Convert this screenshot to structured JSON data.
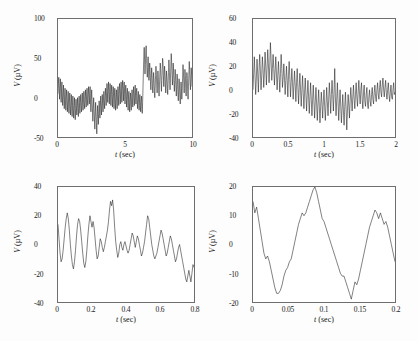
{
  "figure": {
    "background": "#fdfdfd",
    "axis_color": "#6e6e6e",
    "trace_color": "#1a1a1a"
  },
  "chart_data": [
    {
      "id": "panel-top-left",
      "type": "line",
      "title": "",
      "xlabel": "t (sec)",
      "xlabel_italic_part": "t",
      "xlabel_rest": " (sec)",
      "ylabel": "V (µV)",
      "ylabel_italic_part": "V",
      "ylabel_rest": " (µV)",
      "xlim": [
        0,
        10
      ],
      "ylim": [
        -50,
        100
      ],
      "xticks": [
        0,
        5,
        10
      ],
      "xticklabels": [
        "0",
        "5",
        "10"
      ],
      "yticks": [
        -50,
        0,
        50,
        100
      ],
      "yticklabels": [
        "-50",
        "0",
        "50",
        "100"
      ],
      "grid": false,
      "legend": null,
      "description": "10 second raw EEG epoch, broadband noise about 0 uV with bursts",
      "series": [
        {
          "name": "EEG",
          "sampling_note": "dense noisy trace, envelope varies 10-45 uV",
          "values": [
            5,
            18,
            26,
            12,
            -2,
            14,
            24,
            8,
            -6,
            10,
            20,
            2,
            -10,
            6,
            16,
            -2,
            -14,
            2,
            12,
            -4,
            -16,
            0,
            10,
            -6,
            -18,
            -4,
            8,
            -8,
            -20,
            -6,
            6,
            -10,
            -22,
            -8,
            4,
            -12,
            -24,
            -10,
            2,
            -14,
            -26,
            -12,
            0,
            -16,
            -28,
            -14,
            -2,
            -12,
            -22,
            -10,
            0,
            -14,
            -24,
            -8,
            2,
            -12,
            -20,
            -6,
            4,
            -10,
            -18,
            -4,
            6,
            -8,
            -16,
            -2,
            8,
            -6,
            -14,
            0,
            10,
            -4,
            -12,
            2,
            12,
            -2,
            -10,
            4,
            14,
            0,
            -8,
            6,
            14,
            -6,
            -18,
            -2,
            10,
            -4,
            -16,
            -30,
            -14,
            0,
            -12,
            -26,
            -40,
            -22,
            -6,
            -18,
            -32,
            -46,
            -28,
            -10,
            -20,
            -34,
            -20,
            -4,
            -14,
            -26,
            -12,
            2,
            -10,
            -22,
            -8,
            4,
            -8,
            -18,
            -4,
            8,
            -4,
            -14,
            0,
            12,
            2,
            -10,
            6,
            18,
            8,
            -6,
            10,
            20,
            6,
            -8,
            8,
            18,
            4,
            -10,
            6,
            16,
            2,
            -12,
            4,
            14,
            0,
            -14,
            2,
            12,
            -2,
            -16,
            0,
            10,
            -4,
            -14,
            2,
            14,
            4,
            -10,
            8,
            18,
            6,
            -8,
            10,
            20,
            8,
            -6,
            12,
            22,
            10,
            -4,
            14,
            20,
            6,
            -8,
            10,
            16,
            2,
            -12,
            6,
            12,
            -2,
            -16,
            2,
            8,
            -6,
            -18,
            -2,
            6,
            -8,
            -16,
            0,
            10,
            -4,
            -12,
            4,
            14,
            0,
            -10,
            6,
            16,
            2,
            -8,
            8,
            12,
            -4,
            -14,
            0,
            8,
            -6,
            -16,
            -2,
            4,
            -10,
            -18,
            -4,
            2,
            -12,
            -20,
            -6,
            14,
            34,
            52,
            64,
            48,
            30,
            42,
            58,
            66,
            50,
            34,
            26,
            40,
            52,
            38,
            22,
            30,
            44,
            36,
            20,
            10,
            24,
            38,
            30,
            14,
            6,
            18,
            32,
            24,
            8,
            0,
            12,
            28,
            40,
            30,
            16,
            6,
            20,
            34,
            26,
            10,
            2,
            16,
            30,
            44,
            36,
            20,
            8,
            22,
            36,
            50,
            44,
            28,
            14,
            26,
            40,
            32,
            16,
            6,
            20,
            34,
            26,
            12,
            4,
            18,
            32,
            48,
            38,
            22,
            10,
            24,
            40,
            56,
            46,
            30,
            16,
            28,
            44,
            34,
            18,
            8,
            22,
            36,
            28,
            12,
            2,
            16,
            30,
            22,
            6,
            -4,
            10,
            24,
            16,
            0,
            -8,
            6,
            20,
            12,
            -2,
            8,
            26,
            42,
            34,
            18,
            6,
            20,
            36,
            28,
            12,
            2,
            16,
            32,
            24,
            8,
            -2,
            14,
            30,
            46,
            36,
            20,
            10,
            24,
            38,
            30,
            14
          ]
        }
      ]
    },
    {
      "id": "panel-top-right",
      "type": "line",
      "title": "",
      "xlabel": "t (sec)",
      "xlabel_italic_part": "t",
      "xlabel_rest": " (sec)",
      "ylabel": "V (µV)",
      "ylabel_italic_part": "V",
      "ylabel_rest": " (µV)",
      "xlim": [
        0,
        2
      ],
      "ylim": [
        -40,
        60
      ],
      "xticks": [
        0,
        0.5,
        1,
        1.5,
        2
      ],
      "xticklabels": [
        "0",
        "0.5",
        "1",
        "1.5",
        "2"
      ],
      "yticks": [
        -40,
        -20,
        0,
        20,
        40,
        60
      ],
      "yticklabels": [
        "-40",
        "-20",
        "0",
        "20",
        "40",
        "60"
      ],
      "grid": false,
      "legend": null,
      "description": "First 2 seconds expanded, strong alpha rhythm decaying into low amplitude activity",
      "series": [
        {
          "name": "EEG",
          "values": [
            0,
            14,
            28,
            12,
            -4,
            10,
            26,
            14,
            -2,
            16,
            30,
            16,
            0,
            12,
            28,
            18,
            2,
            14,
            32,
            20,
            4,
            18,
            34,
            22,
            6,
            20,
            40,
            26,
            8,
            18,
            30,
            18,
            4,
            16,
            28,
            14,
            0,
            12,
            24,
            12,
            -2,
            14,
            30,
            18,
            2,
            10,
            22,
            10,
            -4,
            8,
            20,
            8,
            -6,
            12,
            24,
            10,
            -6,
            6,
            18,
            6,
            -8,
            4,
            16,
            4,
            -10,
            6,
            18,
            2,
            -12,
            2,
            14,
            0,
            -14,
            0,
            12,
            -2,
            -16,
            -2,
            10,
            -4,
            -18,
            -4,
            8,
            -6,
            -20,
            -6,
            6,
            -8,
            -22,
            -8,
            4,
            -10,
            -24,
            -10,
            2,
            -12,
            -26,
            -12,
            0,
            -14,
            -28,
            -14,
            -2,
            -12,
            -24,
            -10,
            0,
            -14,
            -26,
            -12,
            2,
            -10,
            -22,
            -8,
            6,
            -6,
            -20,
            -4,
            8,
            -4,
            -18,
            -2,
            18,
            -6,
            -22,
            -8,
            6,
            -10,
            -26,
            -12,
            0,
            -14,
            -28,
            -16,
            -4,
            -18,
            -30,
            -14,
            -2,
            -16,
            -34,
            -18,
            -4,
            -12,
            -24,
            -10,
            2,
            -8,
            -18,
            -6,
            4,
            -8,
            -16,
            -4,
            6,
            -6,
            -14,
            -2,
            8,
            -4,
            -12,
            0,
            6,
            -8,
            -16,
            -2,
            4,
            -10,
            -14,
            -4,
            2,
            -12,
            -16,
            -6,
            0,
            -10,
            -14,
            -4,
            2,
            -8,
            -12,
            -2,
            4,
            -6,
            -10,
            0,
            6,
            -4,
            -8,
            2,
            8,
            -2,
            -6,
            4,
            10,
            0,
            -6,
            2,
            8,
            -2,
            -8,
            0,
            6,
            -4,
            -10,
            -2,
            4,
            -6,
            -8,
            0,
            6,
            -4,
            -2
          ]
        }
      ]
    },
    {
      "id": "panel-bottom-left",
      "type": "line",
      "title": "",
      "xlabel": "t (sec)",
      "xlabel_italic_part": "t",
      "xlabel_rest": " (sec)",
      "ylabel": "V (µV)",
      "ylabel_italic_part": "V",
      "ylabel_rest": " (µV)",
      "xlim": [
        0,
        0.8
      ],
      "ylim": [
        -40,
        40
      ],
      "xticks": [
        0,
        0.2,
        0.4,
        0.6,
        0.8
      ],
      "xticklabels": [
        "0",
        "0.2",
        "0.4",
        "0.6",
        "0.8"
      ],
      "yticks": [
        -40,
        -20,
        0,
        20,
        40
      ],
      "yticklabels": [
        "-40",
        "-20",
        "0",
        "20",
        "40"
      ],
      "grid": false,
      "legend": null,
      "description": "First 0.8 seconds expanded, rhythmic oscillation near 10 Hz with peak 31 uV at 0.34 s",
      "series": [
        {
          "name": "EEG",
          "values": [
            14,
            4,
            -6,
            -12,
            -10,
            -4,
            4,
            12,
            18,
            22,
            18,
            10,
            0,
            -8,
            -14,
            -17,
            -12,
            -4,
            6,
            14,
            18,
            16,
            10,
            2,
            -6,
            -13,
            -16,
            -12,
            -4,
            6,
            14,
            20,
            16,
            12,
            16,
            12,
            4,
            -4,
            -10,
            -8,
            -2,
            4,
            2,
            -2,
            -5,
            -2,
            2,
            6,
            10,
            16,
            24,
            30,
            27,
            31,
            24,
            12,
            2,
            -4,
            -9,
            -6,
            0,
            2,
            -2,
            -4,
            0,
            2,
            -1,
            -4,
            -6,
            -4,
            0,
            4,
            8,
            6,
            2,
            -2,
            2,
            6,
            4,
            0,
            -4,
            -8,
            -6,
            -2,
            2,
            8,
            14,
            20,
            18,
            12,
            6,
            0,
            -4,
            -8,
            -10,
            -8,
            -6,
            -2,
            2,
            6,
            10,
            8,
            4,
            0,
            -4,
            -8,
            -6,
            -2,
            2,
            6,
            4,
            0,
            -4,
            -8,
            -12,
            -10,
            -6,
            -2,
            0,
            -4,
            -8,
            -12,
            -16,
            -20,
            -24,
            -26,
            -22,
            -18,
            -22,
            -26,
            -20,
            -14,
            -16
          ]
        }
      ]
    },
    {
      "id": "panel-bottom-right",
      "type": "line",
      "title": "",
      "xlabel": "t (sec)",
      "xlabel_italic_part": "t",
      "xlabel_rest": " (sec)",
      "ylabel": "V (µV)",
      "ylabel_italic_part": "V",
      "ylabel_rest": " (µV)",
      "xlim": [
        0,
        0.2
      ],
      "ylim": [
        -20,
        20
      ],
      "xticks": [
        0,
        0.05,
        0.1,
        0.15,
        0.2
      ],
      "xticklabels": [
        "0",
        "0.05",
        "0.1",
        "0.15",
        "0.2"
      ],
      "yticks": [
        -20,
        -10,
        0,
        10,
        20
      ],
      "yticklabels": [
        "-20",
        "-10",
        "0",
        "10",
        "20"
      ],
      "grid": false,
      "legend": null,
      "description": "First 0.2 seconds expanded, roughly two alpha cycles resolved sample by sample",
      "series": [
        {
          "name": "EEG",
          "values": [
            15,
            11,
            13,
            9,
            5,
            1,
            -3,
            -5,
            -4,
            -6,
            -9,
            -12,
            -15,
            -17,
            -17,
            -16,
            -14,
            -11,
            -9,
            -8,
            -6,
            -5,
            -2,
            1,
            4,
            7,
            9,
            11,
            10,
            11,
            13,
            15,
            17,
            19,
            20,
            18,
            15,
            12,
            9,
            8,
            6,
            4,
            2,
            0,
            -2,
            -4,
            -6,
            -8,
            -10,
            -11,
            -11,
            -13,
            -15,
            -17,
            -19,
            -16,
            -13,
            -14,
            -12,
            -9,
            -6,
            -3,
            0,
            3,
            6,
            8,
            10,
            12,
            11,
            9,
            11,
            9,
            7,
            8,
            6,
            3,
            0,
            -3,
            -6
          ]
        }
      ]
    }
  ]
}
